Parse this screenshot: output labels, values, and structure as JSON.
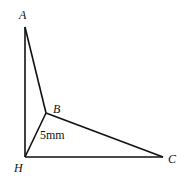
{
  "diagram": {
    "points": {
      "A": {
        "label": "A",
        "x": 25,
        "y": 27
      },
      "B": {
        "label": "B",
        "x": 46,
        "y": 113
      },
      "H": {
        "label": "H",
        "x": 25,
        "y": 157
      },
      "C": {
        "label": "C",
        "x": 163,
        "y": 157
      }
    },
    "edges": [
      [
        "A",
        "H"
      ],
      [
        "A",
        "B"
      ],
      [
        "B",
        "H"
      ],
      [
        "B",
        "C"
      ],
      [
        "H",
        "C"
      ]
    ],
    "measurement": {
      "edge": "BH",
      "text": "5mm"
    }
  }
}
